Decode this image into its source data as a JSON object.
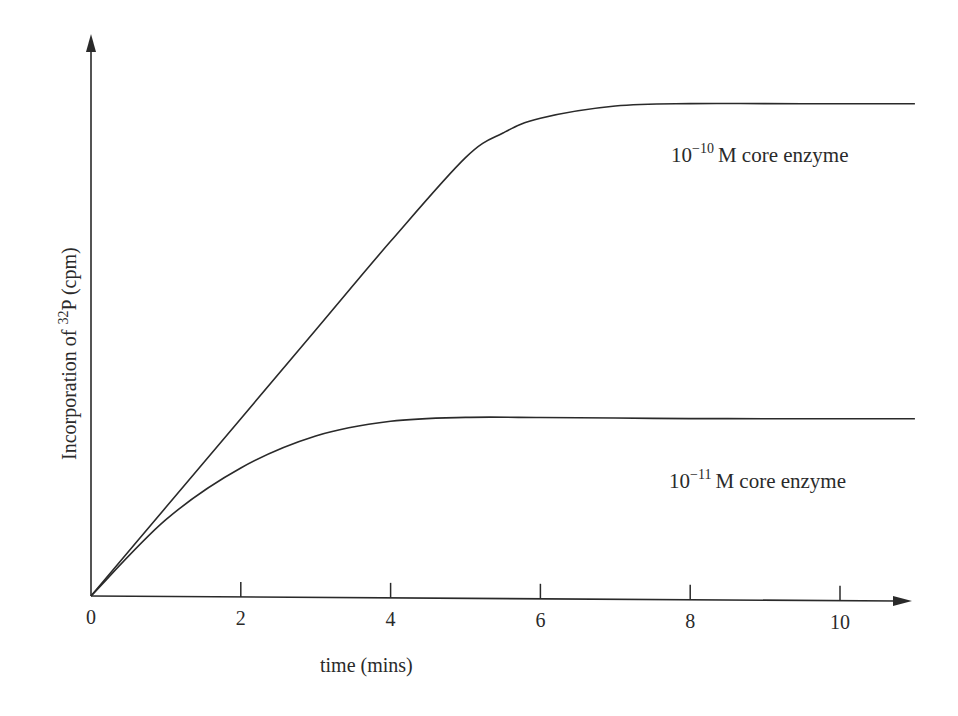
{
  "chart_data": {
    "type": "line",
    "title": "",
    "xlabel": "time (mins)",
    "ylabel": "Incorporation of 32P (cpm)",
    "ylabel_parts": {
      "prefix": "Incorporation of ",
      "sup": "32",
      "suffix": "P (cpm)"
    },
    "xlim": [
      0,
      11
    ],
    "ylim": [
      0,
      100
    ],
    "x_ticks": [
      0,
      2,
      4,
      6,
      8,
      10
    ],
    "x_tick_labels": [
      "0",
      "2",
      "4",
      "6",
      "8",
      "10"
    ],
    "y_ticks": [],
    "grid": false,
    "legend": "inline labels",
    "series": [
      {
        "name": "10^-10 M core enzyme",
        "label_parts": {
          "base": "10",
          "sup": "−10",
          "text": "M core enzyme"
        },
        "color": "#2a2a2a",
        "x": [
          0,
          1,
          2,
          3,
          4,
          5,
          5.5,
          6,
          7,
          8,
          9,
          10,
          11
        ],
        "y": [
          0,
          18,
          36,
          54,
          72,
          89,
          94,
          97,
          99.5,
          100,
          100,
          100,
          100
        ]
      },
      {
        "name": "10^-11 M core enzyme",
        "label_parts": {
          "base": "10",
          "sup": "−11",
          "text": "M core enzyme"
        },
        "color": "#2a2a2a",
        "x": [
          0,
          1,
          2,
          3,
          4,
          5,
          6,
          7,
          8,
          9,
          10,
          11
        ],
        "y": [
          0,
          15.5,
          26,
          32.5,
          35.5,
          36.3,
          36.3,
          36.2,
          36.1,
          36.1,
          36.1,
          36.1
        ]
      }
    ]
  }
}
